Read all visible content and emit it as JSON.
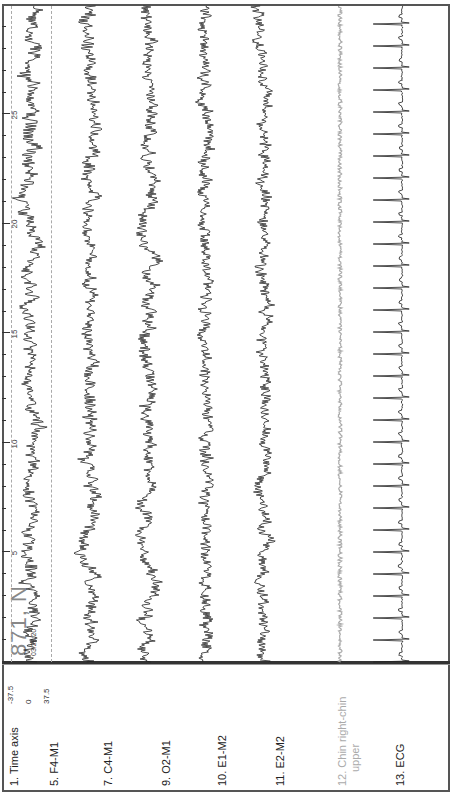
{
  "display": {
    "orientation": "rotated-90-ccw",
    "epoch_number": "871",
    "epoch_stage": "N",
    "epoch_label": "871, N",
    "epoch_start_time": "03:20:20"
  },
  "time_axis": {
    "label": "1. Time axis",
    "ticks": [
      "5",
      "10",
      "15",
      "20",
      "25"
    ],
    "unit_seconds": 30
  },
  "scale": {
    "top": "-37.5",
    "mid": "0",
    "bottom": "37.5"
  },
  "channels": [
    {
      "id": "5",
      "label": "5. F4-M1",
      "color": "#222222"
    },
    {
      "id": "7",
      "label": "7. C4-M1",
      "color": "#222222"
    },
    {
      "id": "9",
      "label": "9. O2-M1",
      "color": "#222222"
    },
    {
      "id": "10",
      "label": "10. E1-M2",
      "color": "#222222"
    },
    {
      "id": "11",
      "label": "11. E2-M2",
      "color": "#222222"
    },
    {
      "id": "12",
      "label_line1": "12. Chin right-chin",
      "label_line2": "upper",
      "color": "#aaaaaa"
    },
    {
      "id": "13",
      "label": "13. ECG",
      "color": "#222222"
    }
  ],
  "colors": {
    "trace": "#222222",
    "chin_trace": "#aaaaaa",
    "border": "#555555",
    "gridline": "#aaaaaa"
  }
}
